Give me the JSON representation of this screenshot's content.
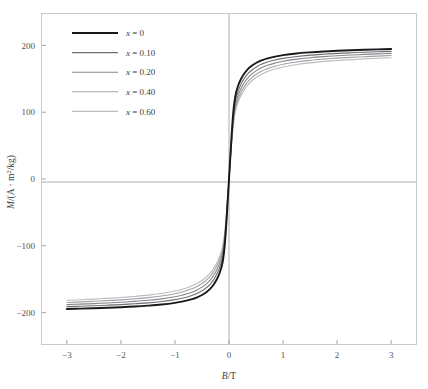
{
  "figure": {
    "background": "#ffffff",
    "frame_color": "#c9c9cc",
    "axis_line_color": "#9a9a9e",
    "tick_color": "#9a9a9e",
    "text_color": "#3c3b40"
  },
  "chart_data": {
    "type": "line",
    "title": "",
    "xlabel": "B/T",
    "ylabel": "M/(A · m²/kg)",
    "xlim": [
      -3.46,
      3.46
    ],
    "ylim": [
      -247,
      247
    ],
    "xticks": [
      -3,
      -2,
      -1,
      0,
      1,
      2,
      3
    ],
    "xticklabels": [
      "−3",
      "−2",
      "−1",
      "0",
      "1",
      "2",
      "3"
    ],
    "yticks": [
      -200,
      -100,
      0,
      100,
      200
    ],
    "yticklabels": [
      "−200",
      "−100",
      "0",
      "100",
      "200"
    ],
    "grid": false,
    "zero_lines": true,
    "legend_position": "upper-left",
    "x": [
      -3.0,
      -2.75,
      -2.5,
      -2.25,
      -2.0,
      -1.75,
      -1.5,
      -1.25,
      -1.0,
      -0.85,
      -0.7,
      -0.6,
      -0.5,
      -0.42,
      -0.35,
      -0.28,
      -0.22,
      -0.17,
      -0.12,
      -0.08,
      -0.05,
      -0.025,
      0,
      0.025,
      0.05,
      0.08,
      0.12,
      0.17,
      0.22,
      0.28,
      0.35,
      0.42,
      0.5,
      0.6,
      0.7,
      0.85,
      1.0,
      1.25,
      1.5,
      1.75,
      2.0,
      2.25,
      2.5,
      2.75,
      3.0
    ],
    "series": [
      {
        "name": "x = 0",
        "x_value": 0,
        "color": "#19191c",
        "width": 1.9,
        "saturation": 196,
        "values": [
          -194.5,
          -194.0,
          -193.4,
          -192.7,
          -191.9,
          -190.9,
          -189.6,
          -187.9,
          -185.4,
          -183.2,
          -180.2,
          -177.4,
          -173.6,
          -169.4,
          -164.6,
          -157.6,
          -149.4,
          -140.0,
          -125.6,
          -100.4,
          -67.8,
          -34.6,
          0,
          34.6,
          67.8,
          100.4,
          125.6,
          140.0,
          149.4,
          157.6,
          164.6,
          169.4,
          173.6,
          177.4,
          180.2,
          183.2,
          185.4,
          187.9,
          189.6,
          190.9,
          191.9,
          192.7,
          193.4,
          194.0,
          194.5
        ]
      },
      {
        "name": "x = 0.10",
        "x_value": 0.1,
        "color": "#6e6e74",
        "width": 1.1,
        "saturation": 193,
        "values": [
          -191.0,
          -190.4,
          -189.7,
          -188.9,
          -188.0,
          -186.8,
          -185.4,
          -183.4,
          -180.6,
          -178.1,
          -174.7,
          -171.6,
          -167.4,
          -162.8,
          -157.6,
          -150.2,
          -141.6,
          -132.0,
          -117.6,
          -93.4,
          -62.6,
          -31.8,
          0,
          31.8,
          62.6,
          93.4,
          117.6,
          132.0,
          141.6,
          150.2,
          157.6,
          162.8,
          167.4,
          171.6,
          174.7,
          178.1,
          180.6,
          183.4,
          185.4,
          186.8,
          188.0,
          188.9,
          189.7,
          190.4,
          191.0
        ]
      },
      {
        "name": "x = 0.20",
        "x_value": 0.2,
        "color": "#86868c",
        "width": 1.1,
        "saturation": 190,
        "values": [
          -188.0,
          -187.3,
          -186.5,
          -185.6,
          -184.5,
          -183.2,
          -181.6,
          -179.4,
          -176.3,
          -173.5,
          -169.8,
          -166.4,
          -161.9,
          -157.0,
          -151.5,
          -143.8,
          -135.0,
          -125.4,
          -111.2,
          -88.0,
          -58.8,
          -29.8,
          0,
          29.8,
          58.8,
          88.0,
          111.2,
          125.4,
          135.0,
          143.8,
          151.5,
          157.0,
          161.9,
          166.4,
          169.8,
          173.5,
          176.3,
          179.4,
          181.6,
          183.2,
          184.5,
          185.6,
          186.5,
          187.3,
          188.0
        ]
      },
      {
        "name": "x = 0.40",
        "x_value": 0.4,
        "color": "#a2a2a8",
        "width": 1.1,
        "saturation": 187,
        "values": [
          -184.8,
          -184.0,
          -183.1,
          -182.1,
          -180.9,
          -179.4,
          -177.6,
          -175.2,
          -171.8,
          -168.8,
          -164.8,
          -161.2,
          -156.5,
          -151.4,
          -145.7,
          -137.9,
          -129.1,
          -119.6,
          -105.8,
          -83.6,
          -55.8,
          -28.2,
          0,
          28.2,
          55.8,
          83.6,
          105.8,
          119.6,
          129.1,
          137.9,
          145.7,
          151.4,
          156.5,
          161.2,
          164.8,
          168.8,
          171.8,
          175.2,
          177.6,
          179.4,
          180.9,
          182.1,
          183.1,
          184.0,
          184.8
        ]
      },
      {
        "name": "x = 0.60",
        "x_value": 0.6,
        "color": "#bcbcc1",
        "width": 1.1,
        "saturation": 184,
        "values": [
          -181.6,
          -180.8,
          -179.8,
          -178.7,
          -177.4,
          -175.8,
          -173.9,
          -171.3,
          -167.7,
          -164.6,
          -160.4,
          -156.7,
          -151.9,
          -146.7,
          -141.0,
          -133.2,
          -124.5,
          -115.2,
          -101.8,
          -80.2,
          -53.4,
          -26.9,
          0,
          26.9,
          53.4,
          80.2,
          101.8,
          115.2,
          124.5,
          133.2,
          141.0,
          146.7,
          151.9,
          156.7,
          160.4,
          164.6,
          167.7,
          171.3,
          173.9,
          175.8,
          177.4,
          178.7,
          179.8,
          180.8,
          181.6
        ]
      }
    ],
    "legend_entries": [
      {
        "symbol": "x",
        "relation": "=",
        "value": "0"
      },
      {
        "symbol": "x",
        "relation": "=",
        "value": "0.10"
      },
      {
        "symbol": "x",
        "relation": "=",
        "value": "0.20"
      },
      {
        "symbol": "x",
        "relation": "=",
        "value": "0.40"
      },
      {
        "symbol": "x",
        "relation": "=",
        "value": "0.60"
      }
    ]
  }
}
